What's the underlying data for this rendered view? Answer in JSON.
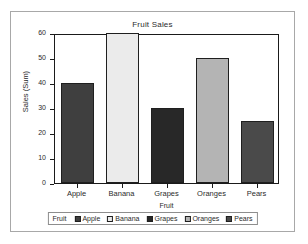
{
  "chart_data": {
    "type": "bar",
    "title": "Fruit Sales",
    "xlabel": "Fruit",
    "ylabel": "Sales (Sum)",
    "categories": [
      "Apple",
      "Banana",
      "Grapes",
      "Oranges",
      "Pears"
    ],
    "values": [
      40,
      60,
      30,
      50,
      25
    ],
    "ylim": [
      0,
      60
    ],
    "ytick_labels": [
      "0",
      "10",
      "20",
      "30",
      "40",
      "50",
      "60"
    ],
    "ytick_values": [
      0,
      10,
      20,
      30,
      40,
      50,
      60
    ],
    "grid": false,
    "legend_position": "bottom",
    "legend_title": "Fruit",
    "legend_entries": [
      {
        "label": "Apple",
        "color": "#3f3f3f"
      },
      {
        "label": "Banana",
        "color": "#ebebeb"
      },
      {
        "label": "Grapes",
        "color": "#282828"
      },
      {
        "label": "Oranges",
        "color": "#b4b4b4"
      },
      {
        "label": "Pears",
        "color": "#4a4a4a"
      }
    ],
    "bar_colors": [
      "#3f3f3f",
      "#ebebeb",
      "#282828",
      "#b4b4b4",
      "#4a4a4a"
    ],
    "bar_border_color": "#1f1f1f",
    "axis_color": "#1a1a1a",
    "frame_color": "#a8a8a8",
    "background": "#ffffff"
  }
}
